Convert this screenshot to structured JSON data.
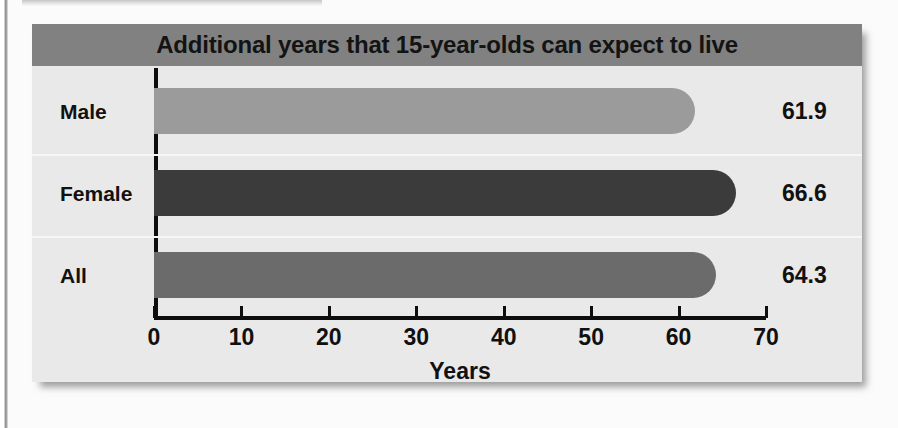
{
  "chart_data": {
    "type": "bar",
    "orientation": "horizontal",
    "title": "Additional years that 15-year-olds can expect to live",
    "xlabel": "Years",
    "ylabel": "",
    "categories": [
      "Male",
      "Female",
      "All"
    ],
    "values": [
      61.9,
      66.6,
      64.3
    ],
    "value_labels": [
      "61.9",
      "66.6",
      "64.3"
    ],
    "series": [
      {
        "name": "Additional years",
        "values": [
          61.9,
          66.6,
          64.3
        ]
      }
    ],
    "xlim": [
      0,
      70
    ],
    "xticks": [
      0,
      10,
      20,
      30,
      40,
      50,
      60,
      70
    ],
    "xtick_labels": [
      "0",
      "10",
      "20",
      "30",
      "40",
      "50",
      "60",
      "70"
    ],
    "grid": false,
    "legend": false,
    "bar_colors": [
      "#9b9b9b",
      "#3b3b3b",
      "#6b6b6b"
    ],
    "title_band_color": "#818181",
    "panel_color": "#e9e9e9",
    "axis_color": "#0d0d0d",
    "text_color": "#111111"
  }
}
